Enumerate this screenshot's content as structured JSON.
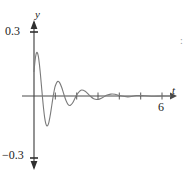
{
  "figure": {
    "name": "damped-oscillation-graph",
    "background_color": "#ffffff",
    "curve_color": "#7a7a7a",
    "axis_color": "#4a4a4a",
    "text_color": "#222222"
  },
  "axes": {
    "y_axis": {
      "label": "y",
      "max_tick_label": "0.3",
      "min_tick_label": "−0.3",
      "range": [
        -0.3,
        0.3
      ],
      "arrow_both_ends": true
    },
    "x_axis": {
      "label": "t",
      "tick_labels": [
        "6"
      ],
      "tick_values": [
        1,
        2,
        3,
        4,
        5,
        6
      ],
      "range": [
        0,
        6.6
      ],
      "arrow_right_end": true
    }
  },
  "edge_artifact": {
    "glyph": ":"
  },
  "chart_data": {
    "type": "line",
    "title": "",
    "xlabel": "t",
    "ylabel": "y",
    "xlim": [
      0,
      6.6
    ],
    "ylim": [
      -0.3,
      0.3
    ],
    "grid": false,
    "legend": "none",
    "xticks": [
      1,
      2,
      3,
      4,
      5,
      6
    ],
    "xticklabels": [
      "",
      "",
      "",
      "",
      "",
      "6"
    ],
    "yticks": [
      -0.3,
      0.3
    ],
    "yticklabels": [
      "−0.3",
      "0.3"
    ],
    "series": [
      {
        "name": "damped-vibration",
        "model": "y = exp(-1.05*t) * (0.115*cos(6.6*t) + 0.205*sin(6.6*t))",
        "x": [
          0.0,
          0.05,
          0.1,
          0.15,
          0.2,
          0.25,
          0.3,
          0.35,
          0.4,
          0.45,
          0.5,
          0.55,
          0.6,
          0.65,
          0.7,
          0.75,
          0.8,
          0.85,
          0.9,
          0.95,
          1.0,
          1.1,
          1.2,
          1.3,
          1.4,
          1.5,
          1.6,
          1.7,
          1.8,
          1.9,
          2.0,
          2.2,
          2.4,
          2.6,
          2.8,
          3.0,
          3.2,
          3.4,
          3.6,
          3.8,
          4.0,
          4.4,
          4.8,
          5.2,
          5.6,
          6.0,
          6.4
        ],
        "y": [
          0.115,
          0.166,
          0.197,
          0.204,
          0.188,
          0.152,
          0.103,
          0.047,
          -0.009,
          -0.06,
          -0.101,
          -0.128,
          -0.14,
          -0.137,
          -0.122,
          -0.097,
          -0.066,
          -0.033,
          -0.001,
          0.027,
          0.048,
          0.068,
          0.063,
          0.04,
          0.008,
          -0.021,
          -0.04,
          -0.044,
          -0.034,
          -0.015,
          0.005,
          0.027,
          0.022,
          0.003,
          -0.013,
          -0.016,
          -0.008,
          0.003,
          0.009,
          0.008,
          0.002,
          -0.004,
          0.002,
          0.001,
          -0.001,
          0.0,
          0.0
        ],
        "color": "#7a7a7a",
        "linewidth": 1.1
      }
    ]
  }
}
